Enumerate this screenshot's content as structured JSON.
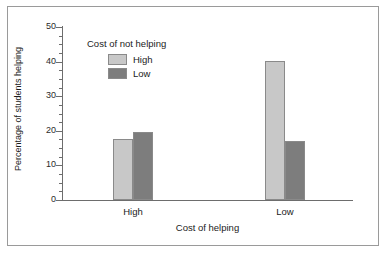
{
  "chart_data": {
    "type": "bar",
    "title": "",
    "subtitle": "",
    "xlabel": "Cost of helping",
    "ylabel": "Percentage of students helping",
    "categories": [
      "High",
      "Low"
    ],
    "series": [
      {
        "name": "High",
        "color": "#c8c8c8",
        "values": [
          17.5,
          40.2
        ]
      },
      {
        "name": "Low",
        "color": "#7d7d7d",
        "values": [
          19.7,
          17.0
        ]
      }
    ],
    "legend": {
      "title": "Cost of not helping",
      "position": "upper-center-inside"
    },
    "ylim": [
      0,
      50
    ],
    "ytick_labels": [
      "0",
      "10",
      "20",
      "30",
      "40",
      "50"
    ],
    "ytick_values": [
      0,
      10,
      20,
      30,
      40,
      50
    ],
    "yminor_step": 2.5,
    "grid": false,
    "axis_color": "#6d6d6d",
    "bar_edge_color": "#8a8a8a",
    "frame_color": "#9a9a9a"
  }
}
